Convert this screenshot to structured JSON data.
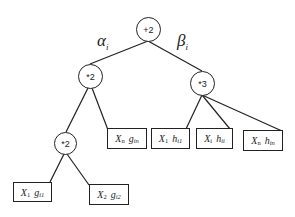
{
  "diagram": {
    "type": "expression-tree",
    "nodes": [
      {
        "id": "root",
        "label": "+2",
        "children": [
          "mul2_left",
          "mul3_right"
        ]
      },
      {
        "id": "mul2_left",
        "label": "*2",
        "children": [
          "mul2_inner",
          "leaf_xn_gin"
        ]
      },
      {
        "id": "mul3_right",
        "label": "*3",
        "children": [
          "leaf_x1_hi1",
          "leaf_xi_hii",
          "leaf_xn_hin"
        ]
      },
      {
        "id": "mul2_inner",
        "label": "*2",
        "children": [
          "leaf_x1_gi1",
          "leaf_x2_gi2"
        ]
      }
    ],
    "edge_weights": {
      "left": {
        "symbol": "α",
        "sub": "i"
      },
      "right": {
        "symbol": "β",
        "sub": "i"
      }
    },
    "leaves": {
      "xn_gin": {
        "var": "X",
        "var_sub": "n",
        "fn": "g",
        "fn_sub": "in"
      },
      "x1_hi1": {
        "var": "X",
        "var_sub": "1",
        "fn": "h",
        "fn_sub": "i1"
      },
      "xi_hii": {
        "var": "X",
        "var_sub": "i",
        "fn": "h",
        "fn_sub": "ii"
      },
      "xn_hin": {
        "var": "X",
        "var_sub": "n",
        "fn": "h",
        "fn_sub": "in"
      },
      "x1_gi1": {
        "var": "X",
        "var_sub": "1",
        "fn": "g",
        "fn_sub": "i1"
      },
      "x2_gi2": {
        "var": "X",
        "var_sub": "2",
        "fn": "g",
        "fn_sub": "i2"
      }
    }
  }
}
